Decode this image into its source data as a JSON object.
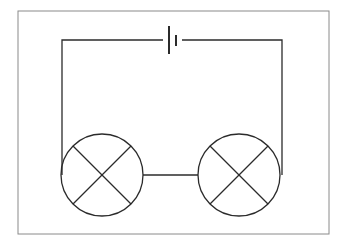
{
  "diagram": {
    "type": "series-circuit",
    "colors": {
      "background": "#ffffff",
      "frame": "#8a8a8a",
      "wire": "#2b2b2b"
    },
    "frame": {
      "x": 18,
      "y": 11,
      "width": 311,
      "height": 223
    },
    "wires": {
      "top_y": 40,
      "left_x": 62,
      "right_x": 282,
      "link_y": 175
    },
    "cell": {
      "name": "battery",
      "long_plate": {
        "x": 169,
        "y1": 26,
        "y2": 54
      },
      "short_plate": {
        "x": 176,
        "y1": 35,
        "y2": 46
      }
    },
    "lamps": [
      {
        "name": "lamp-1",
        "cx": 102,
        "cy": 175,
        "r": 41
      },
      {
        "name": "lamp-2",
        "cx": 239,
        "cy": 175,
        "r": 41
      }
    ]
  }
}
